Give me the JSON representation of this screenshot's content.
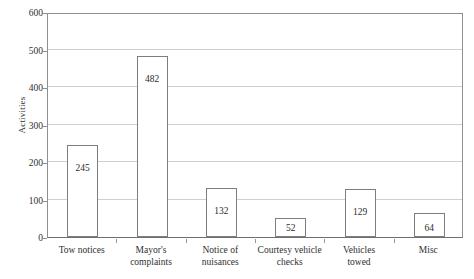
{
  "chart_data": {
    "type": "bar",
    "title": "",
    "xlabel": "",
    "ylabel": "Activities",
    "categories": [
      "Tow notices",
      "Mayor's complaints",
      "Notice of nuisances",
      "Courtesy vehicle checks",
      "Vehicles towed",
      "Misc"
    ],
    "values": [
      245,
      482,
      132,
      52,
      129,
      64
    ],
    "value_labels": [
      "245",
      "482",
      "132",
      "52",
      "129",
      "64"
    ],
    "ylim": [
      0,
      600
    ],
    "ytick_labels": [
      "0",
      "100",
      "200",
      "300",
      "400",
      "500",
      "600"
    ],
    "ytick_values": [
      0,
      100,
      200,
      300,
      400,
      500,
      600
    ],
    "grid": true,
    "legend": "none",
    "bar_fill": "#ffffff",
    "bar_edge": "#7d7d7d",
    "gridline_color": "#cfcfcf",
    "axis_color": "#8f8f8f"
  },
  "axis": {
    "y_title": "Activities"
  },
  "category_lines": [
    [
      "Tow notices",
      ""
    ],
    [
      "Mayor's",
      "complaints"
    ],
    [
      "Notice of",
      "nuisances"
    ],
    [
      "Courtesy vehicle",
      "checks"
    ],
    [
      "Vehicles",
      "towed"
    ],
    [
      "Misc",
      ""
    ]
  ]
}
